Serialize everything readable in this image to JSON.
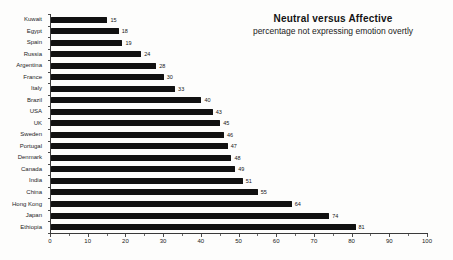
{
  "chart_data": {
    "type": "bar",
    "orientation": "horizontal",
    "title": "Neutral versus Affective",
    "subtitle": "percentage not expressing emotion overtly",
    "categories": [
      "Kuwait",
      "Egypt",
      "Spain",
      "Russia",
      "Argentina",
      "France",
      "Italy",
      "Brazil",
      "USA",
      "UK",
      "Sweden",
      "Portugal",
      "Denmark",
      "Canada",
      "India",
      "China",
      "Hong Kong",
      "Japan",
      "Ethiopia"
    ],
    "values": [
      15,
      18,
      19,
      24,
      28,
      30,
      33,
      40,
      43,
      45,
      46,
      47,
      48,
      49,
      51,
      55,
      64,
      74,
      81
    ],
    "value_labels_shown": true,
    "xlim": [
      0,
      100
    ],
    "xticks": [
      0,
      10,
      20,
      30,
      40,
      50,
      60,
      70,
      80,
      90,
      100
    ],
    "minor_xticks": [
      5,
      15,
      25,
      35,
      45,
      55,
      65,
      75,
      85,
      95
    ],
    "grid": "off",
    "legend": "none",
    "bar_color": "#111111",
    "axis_color": "#3a3a3a",
    "text_color": "#1a1a1a",
    "background_color": "#fdfdfc"
  }
}
